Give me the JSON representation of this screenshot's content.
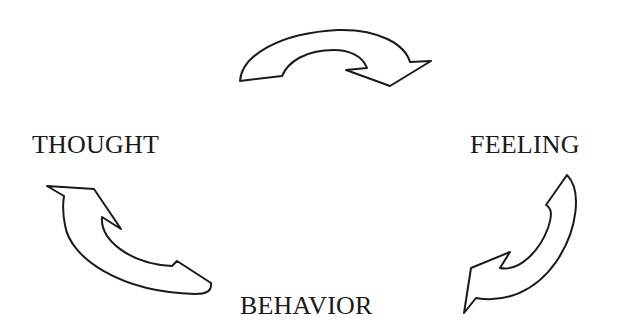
{
  "diagram": {
    "type": "cycle",
    "nodes": [
      {
        "id": "thought",
        "label": "THOUGHT"
      },
      {
        "id": "feeling",
        "label": "FEELING"
      },
      {
        "id": "behavior",
        "label": "BEHAVIOR"
      }
    ],
    "edges": [
      {
        "from": "thought",
        "to": "feeling",
        "direction": "clockwise"
      },
      {
        "from": "feeling",
        "to": "behavior",
        "direction": "clockwise"
      },
      {
        "from": "behavior",
        "to": "thought",
        "direction": "clockwise"
      }
    ],
    "colors": {
      "stroke": "#1a1a1a",
      "fill": "#ffffff",
      "background": "#ffffff"
    }
  }
}
